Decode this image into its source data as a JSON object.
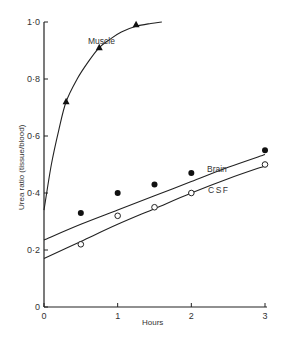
{
  "chart_data": {
    "type": "line",
    "title": "",
    "xlabel": "Hours",
    "ylabel": "Urea ratio (tissue/blood)",
    "xlim": [
      0,
      3
    ],
    "ylim": [
      0,
      1.0
    ],
    "x_ticks": [
      "0",
      "1",
      "2",
      "3"
    ],
    "y_ticks": [
      "0",
      "0·2",
      "0·4",
      "0·6",
      "0·8",
      "1·0"
    ],
    "grid": false,
    "legend": "inline labels",
    "series": [
      {
        "name": "Muscle",
        "marker": "filled-triangle",
        "points": [
          [
            0.3,
            0.72
          ],
          [
            0.75,
            0.91
          ],
          [
            1.25,
            0.99
          ]
        ],
        "curve": [
          [
            0,
            0.34
          ],
          [
            0.1,
            0.5
          ],
          [
            0.2,
            0.62
          ],
          [
            0.3,
            0.72
          ],
          [
            0.45,
            0.8
          ],
          [
            0.6,
            0.86
          ],
          [
            0.75,
            0.91
          ],
          [
            0.9,
            0.94
          ],
          [
            1.05,
            0.965
          ],
          [
            1.25,
            0.985
          ],
          [
            1.45,
            0.995
          ],
          [
            1.6,
            1.0
          ]
        ]
      },
      {
        "name": "Brain",
        "marker": "filled-circle",
        "points": [
          [
            0.5,
            0.33
          ],
          [
            1.0,
            0.4
          ],
          [
            1.5,
            0.43
          ],
          [
            2.0,
            0.47
          ],
          [
            3.0,
            0.55
          ]
        ],
        "curve": [
          [
            0,
            0.235
          ],
          [
            0.5,
            0.29
          ],
          [
            1.0,
            0.34
          ],
          [
            1.5,
            0.39
          ],
          [
            2.0,
            0.44
          ],
          [
            2.5,
            0.49
          ],
          [
            3.0,
            0.535
          ]
        ]
      },
      {
        "name": "CSF",
        "marker": "open-circle",
        "points": [
          [
            0.5,
            0.22
          ],
          [
            1.0,
            0.32
          ],
          [
            1.5,
            0.35
          ],
          [
            2.0,
            0.4
          ],
          [
            3.0,
            0.5
          ]
        ],
        "curve": [
          [
            0,
            0.17
          ],
          [
            0.5,
            0.23
          ],
          [
            1.0,
            0.29
          ],
          [
            1.5,
            0.345
          ],
          [
            2.0,
            0.4
          ],
          [
            2.5,
            0.45
          ],
          [
            3.0,
            0.495
          ]
        ]
      }
    ]
  },
  "labels": {
    "muscle": "Muscle",
    "brain": "Brain",
    "csf": "CSF",
    "xlabel": "Hours",
    "ylabel": "Urea ratio (tissue/blood)"
  }
}
